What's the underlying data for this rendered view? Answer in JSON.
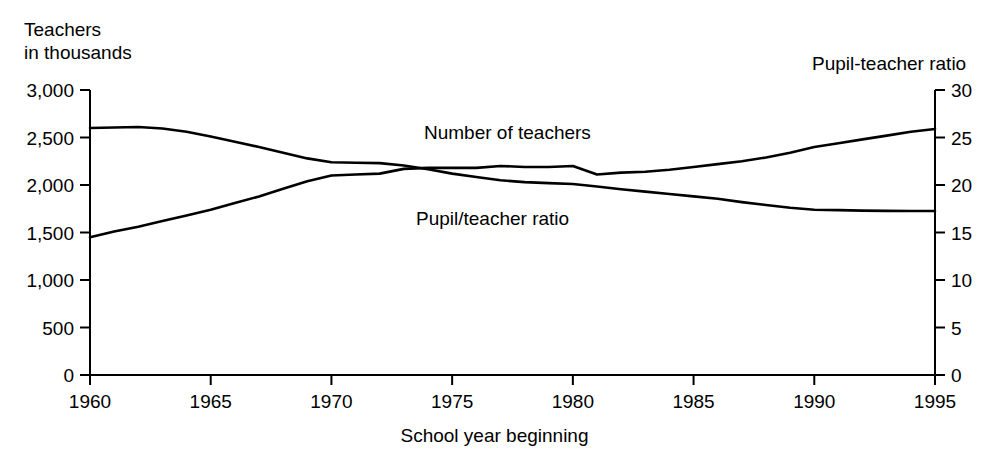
{
  "chart_data": {
    "type": "line",
    "title": "",
    "xlabel": "School year beginning",
    "ylabel": "Teachers\nin thousands",
    "ylabel_right": "Pupil-teacher ratio",
    "grid": false,
    "legend_position": "inline-annotations",
    "x": [
      1960,
      1961,
      1962,
      1963,
      1964,
      1965,
      1966,
      1967,
      1968,
      1969,
      1970,
      1971,
      1972,
      1973,
      1974,
      1975,
      1976,
      1977,
      1978,
      1979,
      1980,
      1981,
      1982,
      1983,
      1984,
      1985,
      1986,
      1987,
      1988,
      1989,
      1990,
      1991,
      1992,
      1993,
      1994,
      1995
    ],
    "xlim": [
      1960,
      1995
    ],
    "xticks": [
      1960,
      1965,
      1970,
      1975,
      1980,
      1985,
      1990,
      1995
    ],
    "xticklabels": [
      "1960",
      "1965",
      "1970",
      "1975",
      "1980",
      "1985",
      "1990",
      "1995"
    ],
    "ylim": [
      0,
      3000
    ],
    "yticks": [
      0,
      500,
      1000,
      1500,
      2000,
      2500,
      3000
    ],
    "yticklabels": [
      "0",
      "500",
      "1,000",
      "1,500",
      "2,000",
      "2,500",
      "3,000"
    ],
    "ylim_right": [
      0,
      30
    ],
    "yticks_right": [
      0,
      5,
      10,
      15,
      20,
      25,
      30
    ],
    "yticklabels_right": [
      "0",
      "5",
      "10",
      "15",
      "20",
      "25",
      "30"
    ],
    "series": [
      {
        "name": "Number of teachers",
        "axis": "left",
        "units": "thousands",
        "color": "#000000",
        "annotation": "Number of teachers",
        "values": [
          2600,
          2605,
          2610,
          2595,
          2560,
          2510,
          2455,
          2400,
          2340,
          2280,
          2240,
          2235,
          2230,
          2205,
          2165,
          2120,
          2085,
          2050,
          2030,
          2020,
          2010,
          1985,
          1955,
          1930,
          1905,
          1880,
          1855,
          1820,
          1790,
          1760,
          1740,
          1735,
          1730,
          1728,
          1727,
          1726
        ]
      },
      {
        "name": "Pupil/teacher ratio",
        "axis": "right",
        "units": "pupils per teacher",
        "color": "#000000",
        "annotation": "Pupil/teacher ratio",
        "values": [
          14.5,
          15.1,
          15.6,
          16.2,
          16.8,
          17.4,
          18.1,
          18.8,
          19.6,
          20.4,
          21.0,
          21.1,
          21.2,
          21.7,
          21.8,
          21.8,
          21.8,
          22.0,
          21.9,
          21.9,
          22.0,
          21.1,
          21.3,
          21.4,
          21.6,
          21.9,
          22.2,
          22.5,
          22.9,
          23.4,
          24.0,
          24.4,
          24.8,
          25.2,
          25.6,
          25.9
        ]
      }
    ]
  }
}
